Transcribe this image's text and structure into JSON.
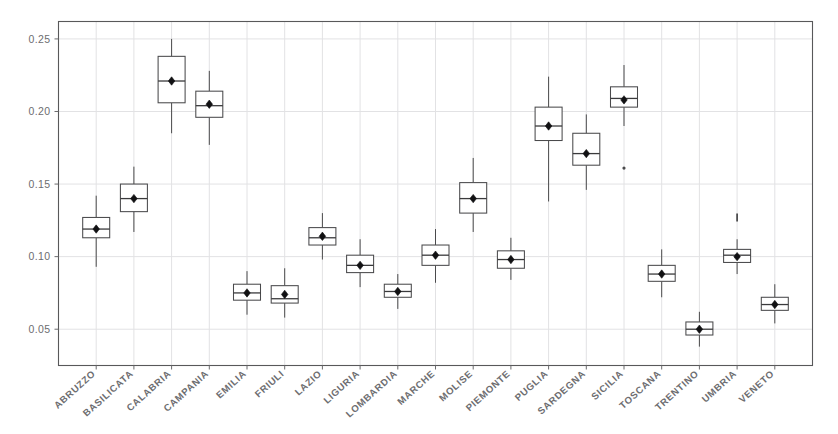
{
  "figure": {
    "width": 838,
    "height": 434,
    "background": "#ffffff"
  },
  "chart_data": {
    "type": "box",
    "title": "",
    "subtitle": "",
    "xlabel": "",
    "ylabel": "",
    "ylim": [
      0.025,
      0.262
    ],
    "xlim": [
      0,
      20
    ],
    "grid": "light vertical and horizontal gridlines",
    "legend": "none",
    "y_ticks": [
      0.05,
      0.1,
      0.15,
      0.2,
      0.25
    ],
    "y_tick_labels": [
      "0.05",
      "0.10",
      "0.15",
      "0.20",
      "0.25"
    ],
    "marker_note": "filled diamond marks the mean of each group",
    "categories": [
      "ABRUZZO",
      "BASILICATA",
      "CALABRIA",
      "CAMPANIA",
      "EMILIA",
      "FRIULI",
      "LAZIO",
      "LIGURIA",
      "LOMBARDIA",
      "MARCHE",
      "MOLISE",
      "PIEMONTE",
      "PUGLIA",
      "SARDEGNA",
      "SICILIA",
      "TOSCANA",
      "TRENTINO",
      "UMBRIA",
      "VENETO"
    ],
    "boxes": [
      {
        "category": "ABRUZZO",
        "whisker_low": 0.093,
        "q1": 0.113,
        "median": 0.119,
        "q3": 0.127,
        "whisker_high": 0.142,
        "mean": 0.119,
        "outliers": []
      },
      {
        "category": "BASILICATA",
        "whisker_low": 0.117,
        "q1": 0.131,
        "median": 0.14,
        "q3": 0.15,
        "whisker_high": 0.162,
        "mean": 0.14,
        "outliers": []
      },
      {
        "category": "CALABRIA",
        "whisker_low": 0.185,
        "q1": 0.206,
        "median": 0.221,
        "q3": 0.238,
        "whisker_high": 0.25,
        "mean": 0.221,
        "outliers": []
      },
      {
        "category": "CAMPANIA",
        "whisker_low": 0.177,
        "q1": 0.196,
        "median": 0.204,
        "q3": 0.214,
        "whisker_high": 0.228,
        "mean": 0.205,
        "outliers": []
      },
      {
        "category": "EMILIA",
        "whisker_low": 0.06,
        "q1": 0.07,
        "median": 0.075,
        "q3": 0.081,
        "whisker_high": 0.09,
        "mean": 0.075,
        "outliers": []
      },
      {
        "category": "FRIULI",
        "whisker_low": 0.058,
        "q1": 0.068,
        "median": 0.071,
        "q3": 0.08,
        "whisker_high": 0.092,
        "mean": 0.074,
        "outliers": []
      },
      {
        "category": "LAZIO",
        "whisker_low": 0.098,
        "q1": 0.108,
        "median": 0.113,
        "q3": 0.12,
        "whisker_high": 0.13,
        "mean": 0.114,
        "outliers": []
      },
      {
        "category": "LIGURIA",
        "whisker_low": 0.079,
        "q1": 0.089,
        "median": 0.094,
        "q3": 0.101,
        "whisker_high": 0.112,
        "mean": 0.094,
        "outliers": []
      },
      {
        "category": "LOMBARDIA",
        "whisker_low": 0.064,
        "q1": 0.072,
        "median": 0.076,
        "q3": 0.081,
        "whisker_high": 0.088,
        "mean": 0.076,
        "outliers": []
      },
      {
        "category": "MARCHE",
        "whisker_low": 0.082,
        "q1": 0.094,
        "median": 0.101,
        "q3": 0.108,
        "whisker_high": 0.119,
        "mean": 0.101,
        "outliers": []
      },
      {
        "category": "MOLISE",
        "whisker_low": 0.117,
        "q1": 0.13,
        "median": 0.14,
        "q3": 0.151,
        "whisker_high": 0.168,
        "mean": 0.14,
        "outliers": []
      },
      {
        "category": "PIEMONTE",
        "whisker_low": 0.084,
        "q1": 0.092,
        "median": 0.098,
        "q3": 0.104,
        "whisker_high": 0.113,
        "mean": 0.098,
        "outliers": []
      },
      {
        "category": "PUGLIA",
        "whisker_low": 0.138,
        "q1": 0.18,
        "median": 0.19,
        "q3": 0.203,
        "whisker_high": 0.224,
        "mean": 0.19,
        "outliers": []
      },
      {
        "category": "SARDEGNA",
        "whisker_low": 0.146,
        "q1": 0.163,
        "median": 0.171,
        "q3": 0.185,
        "whisker_high": 0.198,
        "mean": 0.171,
        "outliers": []
      },
      {
        "category": "SICILIA",
        "whisker_low": 0.19,
        "q1": 0.203,
        "median": 0.209,
        "q3": 0.217,
        "whisker_high": 0.232,
        "mean": 0.208,
        "outliers": [
          0.161
        ]
      },
      {
        "category": "TOSCANA",
        "whisker_low": 0.072,
        "q1": 0.083,
        "median": 0.088,
        "q3": 0.094,
        "whisker_high": 0.105,
        "mean": 0.088,
        "outliers": []
      },
      {
        "category": "TRENTINO",
        "whisker_low": 0.038,
        "q1": 0.046,
        "median": 0.05,
        "q3": 0.055,
        "whisker_high": 0.062,
        "mean": 0.05,
        "outliers": []
      },
      {
        "category": "UMBRIA",
        "whisker_low": 0.088,
        "q1": 0.096,
        "median": 0.101,
        "q3": 0.105,
        "whisker_high": 0.112,
        "mean": 0.1,
        "outliers": [
          0.127
        ]
      },
      {
        "category": "VENETO",
        "whisker_low": 0.054,
        "q1": 0.063,
        "median": 0.067,
        "q3": 0.072,
        "whisker_high": 0.081,
        "mean": 0.067,
        "outliers": []
      }
    ]
  },
  "colors": {
    "frame": "#58585a",
    "box_stroke": "#4a4a4c",
    "median": "#3a3a3c",
    "mean_marker": "#111113",
    "grid": "#e2e2e4",
    "tick_text": "#6d6d70",
    "background": "#ffffff"
  }
}
